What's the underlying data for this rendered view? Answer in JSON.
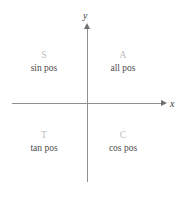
{
  "diagram": {
    "background_color": "#ffffff",
    "axis_color": "#8f8f8f",
    "letter_color": "#bdbdbd",
    "text_color": "#4a4a4a"
  },
  "axes": {
    "x_label": "x",
    "y_label": "y"
  },
  "quadrants": [
    {
      "id": "sin",
      "letter": "S",
      "text": "sin pos"
    },
    {
      "id": "all",
      "letter": "A",
      "text": "all pos"
    },
    {
      "id": "tan",
      "letter": "T",
      "text": "tan pos"
    },
    {
      "id": "cos",
      "letter": "C",
      "text": "cos pos"
    }
  ]
}
